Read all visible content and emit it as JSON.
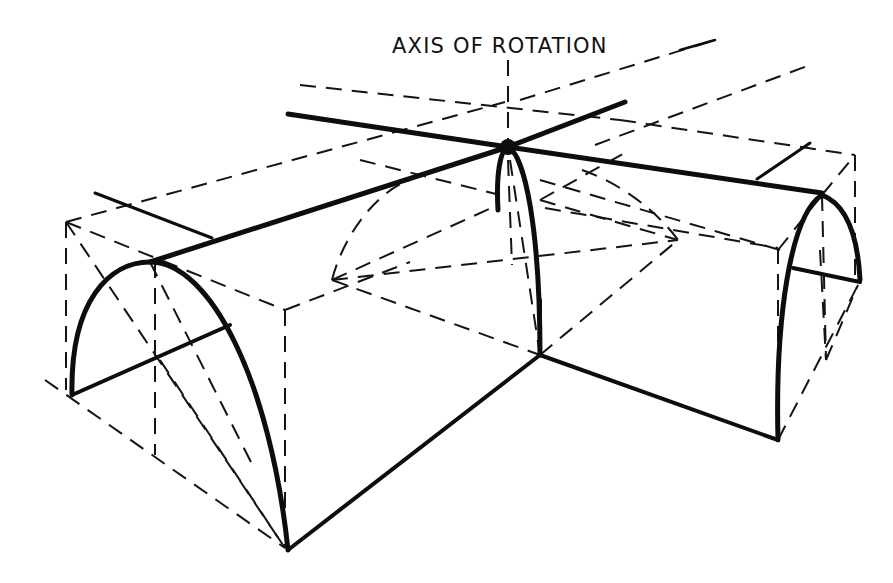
{
  "figure": {
    "label": "AXIS OF ROTATION",
    "label_pos": {
      "x": 392,
      "y": 34
    },
    "ink_color": "#0d0d0d",
    "background": "#ffffff"
  },
  "diagram": {
    "solid_paths": [
      {
        "name": "ridge-left-barrel",
        "d": "M150 262 L508 147",
        "w": 5
      },
      {
        "name": "ridge-right-barrel",
        "d": "M508 147 L822 193",
        "w": 5
      },
      {
        "name": "cross-ridge-back",
        "d": "M288 114 L508 147",
        "w": 5
      },
      {
        "name": "cross-ridge-front",
        "d": "M508 147 L625 102",
        "w": 5
      },
      {
        "name": "left-barrel-arch",
        "d": "M72 395 C70 300 110 262 150 262 C210 262 270 380 288 550",
        "w": 5
      },
      {
        "name": "left-barrel-springline",
        "d": "M72 395 L230 325",
        "w": 4
      },
      {
        "name": "left-top-tick",
        "d": "M95 193 L212 238",
        "w": 3
      },
      {
        "name": "right-barrel-arch-front",
        "d": "M778 440 C775 320 790 215 822 195",
        "w": 5
      },
      {
        "name": "right-barrel-arch-back",
        "d": "M822 195 C848 205 858 240 860 280",
        "w": 5
      },
      {
        "name": "right-barrel-springline",
        "d": "M793 268 L860 282",
        "w": 4
      },
      {
        "name": "right-top-tick",
        "d": "M757 179 L810 143",
        "w": 3
      },
      {
        "name": "central-groin-arch",
        "d": "M498 210 C496 175 500 150 508 147 C525 155 540 230 540 355",
        "w": 5
      },
      {
        "name": "bottom-edge-left",
        "d": "M288 550 L540 355",
        "w": 4
      },
      {
        "name": "bottom-edge-right",
        "d": "M540 355 L778 440",
        "w": 4
      },
      {
        "name": "inner-corner-post",
        "d": "M540 300 L540 355",
        "w": 4
      }
    ],
    "dashed_paths": [
      {
        "name": "axis-of-rotation",
        "d": "M508 60 L508 147"
      },
      {
        "name": "label-leader",
        "d": "M520 100 L715 40"
      },
      {
        "name": "left-box-top-back",
        "d": "M66 222 L505 102"
      },
      {
        "name": "left-box-top-side",
        "d": "M66 222 L285 310"
      },
      {
        "name": "left-box-vertical-back",
        "d": "M66 222 L66 390"
      },
      {
        "name": "left-box-vertical-front",
        "d": "M285 310 L285 548"
      },
      {
        "name": "left-box-top-front",
        "d": "M285 310 L410 262"
      },
      {
        "name": "left-diagonal-1",
        "d": "M66 222 L285 548"
      },
      {
        "name": "left-centerline",
        "d": "M155 262 L155 455"
      },
      {
        "name": "left-diagonal-2",
        "d": "M150 262 L255 470"
      },
      {
        "name": "left-floor-diagonal",
        "d": "M45 380 L285 548"
      },
      {
        "name": "left-floor-diagonal-2",
        "d": "M160 360 L285 548"
      },
      {
        "name": "top-plane-far-1",
        "d": "M300 85 L620 120"
      },
      {
        "name": "top-plane-far-2",
        "d": "M620 120 L855 155"
      },
      {
        "name": "top-plane-back-right",
        "d": "M595 145 L810 65"
      },
      {
        "name": "right-box-top-back",
        "d": "M855 155 L855 280"
      },
      {
        "name": "right-box-top-front",
        "d": "M822 195 L855 155"
      },
      {
        "name": "right-box-side-top",
        "d": "M545 208 L778 248"
      },
      {
        "name": "right-box-vertical",
        "d": "M778 248 L778 440"
      },
      {
        "name": "right-box-bottom-diag",
        "d": "M778 440 L858 285"
      },
      {
        "name": "right-centerline",
        "d": "M822 195 L826 360"
      },
      {
        "name": "right-diag",
        "d": "M820 250 L826 360"
      },
      {
        "name": "right-lower-diag",
        "d": "M826 360 L858 285"
      },
      {
        "name": "dome-curve-left",
        "d": "M332 280 C345 230 380 190 410 180"
      },
      {
        "name": "dome-curve-right",
        "d": "M582 170 C625 185 660 215 678 240"
      },
      {
        "name": "dome-cross-1",
        "d": "M332 280 L498 205"
      },
      {
        "name": "dome-cross-2",
        "d": "M332 280 L678 240"
      },
      {
        "name": "dome-cross-3",
        "d": "M332 280 L540 355"
      },
      {
        "name": "dome-cross-4",
        "d": "M540 355 L678 240"
      },
      {
        "name": "dome-cross-5",
        "d": "M540 200 L678 240"
      },
      {
        "name": "dome-cross-6",
        "d": "M510 160 L540 355"
      },
      {
        "name": "dome-vertical-inner",
        "d": "M508 160 L512 265"
      },
      {
        "name": "dome-top-diag",
        "d": "M540 200 L630 150"
      },
      {
        "name": "centre-to-right-diag",
        "d": "M540 180 L780 250"
      },
      {
        "name": "left-ridge-dash",
        "d": "M360 160 L500 195"
      },
      {
        "name": "right-near-arch",
        "d": "M778 250 L822 195"
      }
    ]
  }
}
